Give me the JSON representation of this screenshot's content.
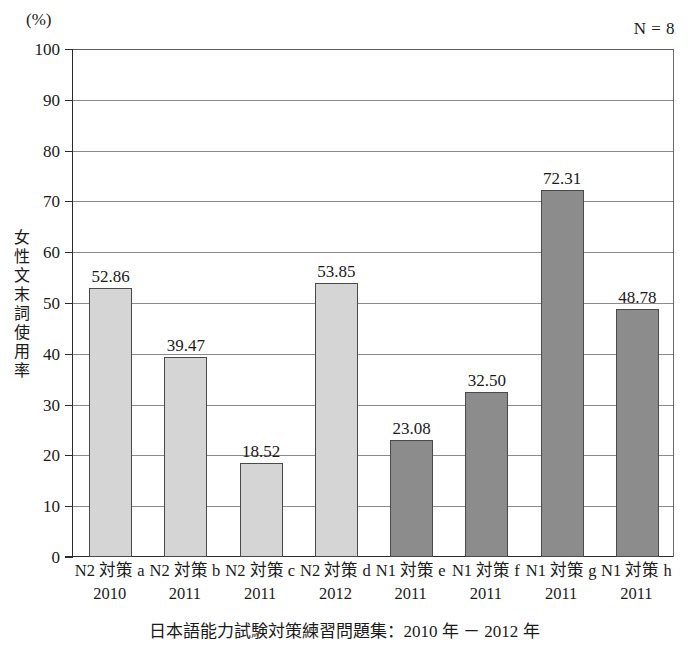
{
  "chart_data": {
    "type": "bar",
    "title": "",
    "subtitle": "",
    "unit_label": "(%)",
    "sample_size_label": "N = 8",
    "ylabel": "女性文末詞使用率",
    "xlabel": "",
    "caption": "日本語能力試験対策練習問題集：2010 年 － 2012 年",
    "ylim": [
      0,
      100
    ],
    "ytick_step": 10,
    "grid": true,
    "legend": "none",
    "categories": [
      "N2 対策 a",
      "N2 対策 b",
      "N2 対策 c",
      "N2 対策 d",
      "N1 対策 e",
      "N1 対策 f",
      "N1 対策 g",
      "N1 対策 h"
    ],
    "years": [
      "2010",
      "2011",
      "2011",
      "2012",
      "2011",
      "2011",
      "2011",
      "2011"
    ],
    "values": [
      52.86,
      39.47,
      18.52,
      53.85,
      23.08,
      32.5,
      72.31,
      48.78
    ],
    "value_labels": [
      "52.86",
      "39.47",
      "18.52",
      "53.85",
      "23.08",
      "32.50",
      "72.31",
      "48.78"
    ],
    "groups": [
      "N2",
      "N2",
      "N2",
      "N2",
      "N1",
      "N1",
      "N1",
      "N1"
    ],
    "ytick_labels": [
      "0",
      "10",
      "20",
      "30",
      "40",
      "50",
      "60",
      "70",
      "80",
      "90",
      "100"
    ],
    "colors": {
      "n2_bar": "#d5d5d5",
      "n1_bar": "#8c8c8c",
      "bar_border": "#4a4a4a",
      "gridline": "#8a8a8a",
      "axis": "#2b2b2b",
      "text": "#1a1a1a",
      "background": "#ffffff"
    }
  },
  "y_axis_title_chars": [
    "女",
    "性",
    "文",
    "末",
    "詞",
    "使",
    "用",
    "率"
  ]
}
